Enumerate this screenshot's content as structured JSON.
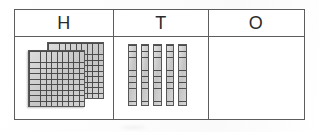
{
  "worksheet": {
    "type": "place-value-chart",
    "description": "Base-ten blocks place value chart with Hundreds, Tens and Ones columns",
    "columns": [
      {
        "key": "hundreds",
        "header": "H",
        "block_type": "hundred-flat",
        "count": 2,
        "value": 200,
        "flats": [
          {
            "name": "flat-back",
            "rows": 10,
            "cols": 10
          },
          {
            "name": "flat-front",
            "rows": 10,
            "cols": 10
          }
        ]
      },
      {
        "key": "tens",
        "header": "T",
        "block_type": "ten-rod",
        "count": 5,
        "value": 50,
        "rods": [
          {
            "name": "rod-1",
            "units": 10
          },
          {
            "name": "rod-2",
            "units": 10
          },
          {
            "name": "rod-3",
            "units": 10
          },
          {
            "name": "rod-4",
            "units": 10
          },
          {
            "name": "rod-5",
            "units": 10
          }
        ]
      },
      {
        "key": "ones",
        "header": "O",
        "block_type": "unit-cube",
        "count": 0,
        "value": 0,
        "cubes": []
      }
    ],
    "total_value": 250
  },
  "colors": {
    "border": "#5d5d5d",
    "block_fill": "#cfcfcf",
    "block_line": "#464646",
    "text": "#2b2b2b",
    "page": "#ffffff"
  }
}
